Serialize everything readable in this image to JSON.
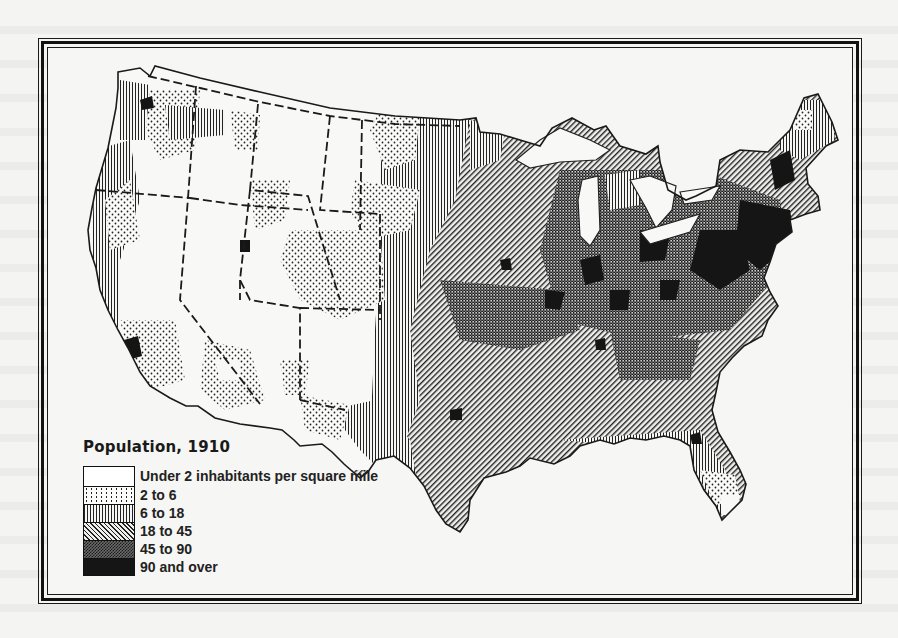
{
  "map": {
    "title": "Population, 1910",
    "subject": "Population density of the United States by county, 1910",
    "legend": [
      {
        "label": "Under 2 inhabitants per square mile",
        "pattern": "blank",
        "fill": "#ffffff"
      },
      {
        "label": "2 to 6",
        "pattern": "dots",
        "fill": "url(#p-dots)"
      },
      {
        "label": "6 to 18",
        "pattern": "vertical-lines",
        "fill": "url(#p-vert)"
      },
      {
        "label": "18 to 45",
        "pattern": "diagonal-lines",
        "fill": "url(#p-diag)"
      },
      {
        "label": "45 to 90",
        "pattern": "crosshatch",
        "fill": "url(#p-cross)"
      },
      {
        "label": "90 and over",
        "pattern": "solid-black",
        "fill": "#151515"
      }
    ]
  }
}
